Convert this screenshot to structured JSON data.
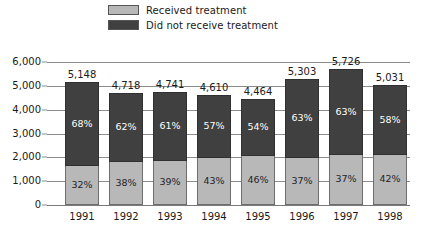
{
  "legend": {
    "items": [
      {
        "label": "Received treatment",
        "color": "#b8b8b8",
        "key": "received"
      },
      {
        "label": "Did not receive treatment",
        "color": "#404040",
        "key": "not_received"
      }
    ]
  },
  "axis": {
    "y_ticks": [
      "6,000",
      "5,000",
      "4,000",
      "3,000",
      "2,000",
      "1,000",
      "0"
    ],
    "x_ticks": [
      "1991",
      "1992",
      "1993",
      "1994",
      "1995",
      "1996",
      "1997",
      "1998"
    ]
  },
  "bar_totals": [
    "5,148",
    "4,718",
    "4,741",
    "4,610",
    "4,464",
    "5,303",
    "5,726",
    "5,031"
  ],
  "top_labels": [
    "68%",
    "62%",
    "61%",
    "57%",
    "54%",
    "63%",
    "63%",
    "58%"
  ],
  "bottom_labels": [
    "32%",
    "38%",
    "39%",
    "43%",
    "46%",
    "37%",
    "37%",
    "42%"
  ],
  "chart_data": {
    "type": "bar",
    "subtype": "stacked-percentage",
    "title": "",
    "xlabel": "",
    "ylabel": "",
    "ylim": [
      0,
      6000
    ],
    "ytick_values": [
      0,
      1000,
      2000,
      3000,
      4000,
      5000,
      6000
    ],
    "grid": true,
    "legend_position": "top",
    "categories": [
      "1991",
      "1992",
      "1993",
      "1994",
      "1995",
      "1996",
      "1997",
      "1998"
    ],
    "totals": [
      5148,
      4718,
      4741,
      4610,
      4464,
      5303,
      5726,
      5031
    ],
    "series": [
      {
        "name": "Did not receive treatment",
        "color": "#404040",
        "percent": [
          68,
          62,
          61,
          57,
          54,
          63,
          63,
          58
        ],
        "percent_labels": [
          "68%",
          "62%",
          "61%",
          "57%",
          "54%",
          "63%",
          "63%",
          "58%"
        ],
        "values": [
          3501,
          2925,
          2892,
          2628,
          2411,
          3341,
          3607,
          2918
        ]
      },
      {
        "name": "Received treatment",
        "color": "#b8b8b8",
        "percent": [
          32,
          38,
          39,
          43,
          46,
          37,
          37,
          42
        ],
        "percent_labels": [
          "32%",
          "38%",
          "39%",
          "43%",
          "46%",
          "37%",
          "37%",
          "42%"
        ],
        "values": [
          1647,
          1793,
          1849,
          1982,
          2053,
          1962,
          2119,
          2113
        ]
      }
    ],
    "total_labels": [
      "5,148",
      "4,718",
      "4,741",
      "4,610",
      "4,464",
      "5,303",
      "5,726",
      "5,031"
    ]
  }
}
